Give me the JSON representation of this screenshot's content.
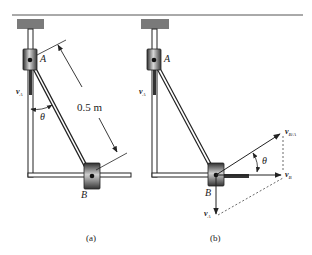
{
  "figure": {
    "panels": [
      {
        "id": "a",
        "caption": "(a)",
        "labels": {
          "point_a": "A",
          "point_b": "B",
          "velocity_a": "v",
          "velocity_a_sub": "A",
          "angle": "θ",
          "length": "0.5 m"
        }
      },
      {
        "id": "b",
        "caption": "(b)",
        "labels": {
          "point_a": "A",
          "point_b": "B",
          "velocity_a": "v",
          "velocity_a_sub": "A",
          "velocity_a_bottom": "v",
          "velocity_a_bottom_sub": "A",
          "velocity_b": "v",
          "velocity_b_sub": "B",
          "velocity_ba": "v",
          "velocity_ba_sub": "B/A",
          "angle": "θ"
        }
      }
    ],
    "colors": {
      "line": "#222222",
      "ceiling": "#7a7a7a",
      "collar_dark": "#3a3a3a",
      "collar_light": "#d8d8d8",
      "rail": "#ffffff"
    }
  }
}
